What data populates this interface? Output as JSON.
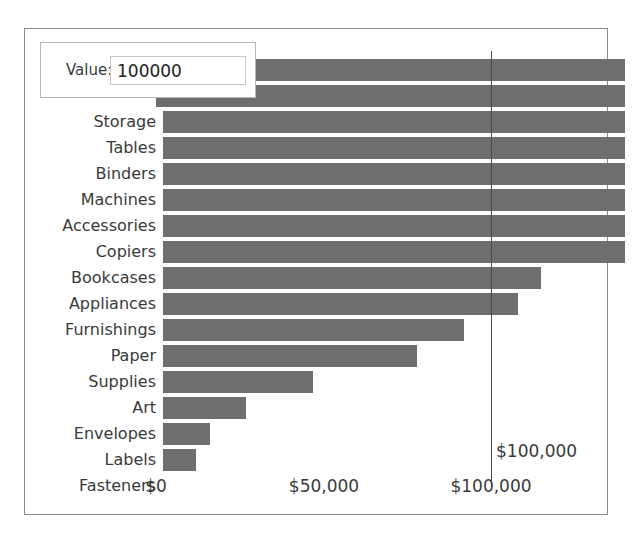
{
  "panel": {
    "background_color": "#ffffff",
    "border_color": "#8a8a8a"
  },
  "value_control": {
    "name": "value-parameter-control",
    "label": "Value:",
    "input_value": "100000",
    "placeholder": ""
  },
  "chart_data": {
    "type": "bar",
    "orientation": "horizontal",
    "title": "",
    "xlabel": "",
    "ylabel": "",
    "bar_color": "#6e6e6e",
    "grid": false,
    "legend": null,
    "xlim": [
      0,
      140000
    ],
    "axis_ticks": [
      "$0",
      "$50,000",
      "$100,000"
    ],
    "axis_tick_values": [
      0,
      50000,
      100000
    ],
    "reference_line": {
      "value": 100000,
      "label": "$100,000",
      "color": "#4a4a4a"
    },
    "categories": [
      "Phones",
      "Chairs",
      "Storage",
      "Tables",
      "Binders",
      "Machines",
      "Accessories",
      "Copiers",
      "Bookcases",
      "Appliances",
      "Furnishings",
      "Paper",
      "Supplies",
      "Art",
      "Envelopes",
      "Labels",
      "Fasteners"
    ],
    "values": [
      140000,
      140000,
      140000,
      140000,
      140000,
      140000,
      140000,
      140000,
      115000,
      108000,
      92000,
      78000,
      47000,
      27000,
      16000,
      12000,
      2000
    ],
    "hidden_labels": [
      "Phones",
      "Chairs"
    ]
  }
}
